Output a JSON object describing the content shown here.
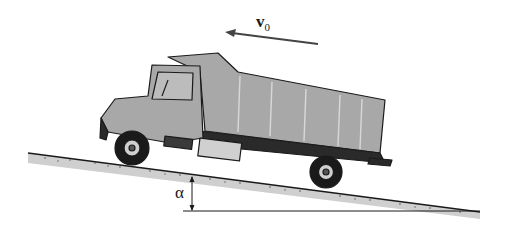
{
  "diagram": {
    "velocity_label": {
      "symbol": "v",
      "subscript": "0"
    },
    "angle_label": "α",
    "colors": {
      "ink": "#1a1a1a",
      "ground_fill": "#cfcfcf",
      "truck_body": "#a8a8a8",
      "truck_dark": "#2a2a2a",
      "bed_panel": "#b4b4b4"
    },
    "incline": {
      "from": [
        28,
        153
      ],
      "to": [
        480,
        212
      ]
    },
    "horizontal_reference": {
      "from": [
        183,
        211
      ],
      "to": [
        480,
        211
      ]
    },
    "velocity_arrow": {
      "from": [
        318,
        44
      ],
      "to": [
        225,
        32
      ],
      "direction": "up-slope (left)"
    }
  }
}
